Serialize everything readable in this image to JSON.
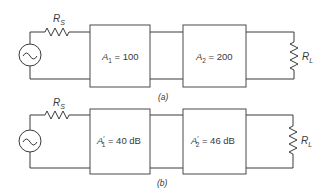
{
  "diagram": {
    "colors": {
      "line": "#3a3a3a",
      "background": "#ffffff"
    },
    "circuit_a": {
      "caption": "(a)",
      "source_resistor": {
        "symbol": "R",
        "subscript": "S"
      },
      "stage1": {
        "symbol": "A",
        "subscript": "1",
        "prime": "",
        "rest": " = 100"
      },
      "stage2": {
        "symbol": "A",
        "subscript": "2",
        "prime": "",
        "rest": " = 200"
      },
      "load_resistor": {
        "symbol": "R",
        "subscript": "L"
      }
    },
    "circuit_b": {
      "caption": "(b)",
      "source_resistor": {
        "symbol": "R",
        "subscript": "S"
      },
      "stage1": {
        "symbol": "A",
        "subscript": "1",
        "prime": "′",
        "rest": " = 40 dB"
      },
      "stage2": {
        "symbol": "A",
        "subscript": "2",
        "prime": "′",
        "rest": " = 46 dB"
      },
      "load_resistor": {
        "symbol": "R",
        "subscript": "L"
      }
    }
  }
}
